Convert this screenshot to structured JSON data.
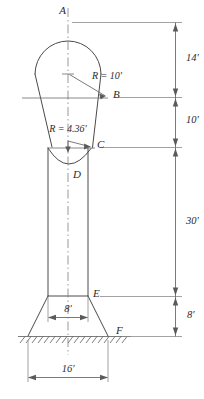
{
  "figure": {
    "points": [
      {
        "id": "A",
        "label": "A",
        "x": 66,
        "y": 14
      },
      {
        "id": "B",
        "label": "B",
        "x": 113,
        "y": 98
      },
      {
        "id": "C",
        "label": "C",
        "x": 97,
        "y": 148
      },
      {
        "id": "D",
        "label": "D",
        "x": 73,
        "y": 178
      },
      {
        "id": "E",
        "label": "E",
        "x": 93,
        "y": 297
      },
      {
        "id": "F",
        "label": "F",
        "x": 116,
        "y": 334
      }
    ],
    "radius_callouts": [
      {
        "id": "r-sphere",
        "label": "R = 10'",
        "value": 10,
        "unit": "ft",
        "x": 92,
        "y": 79
      },
      {
        "id": "r-fillet",
        "label": "R = 4.36'",
        "value": 4.36,
        "unit": "ft",
        "x": 68,
        "y": 132
      }
    ],
    "vertical_dimensions": [
      {
        "id": "dim-14",
        "label": "14'",
        "value": 14,
        "unit": "ft",
        "from": "A",
        "to": "B",
        "x": 186,
        "y": 61
      },
      {
        "id": "dim-10",
        "label": "10'",
        "value": 10,
        "unit": "ft",
        "from": "B",
        "to": "C",
        "x": 186,
        "y": 123
      },
      {
        "id": "dim-30",
        "label": "30'",
        "value": 30,
        "unit": "ft",
        "from": "C",
        "to": "E",
        "x": 186,
        "y": 224
      },
      {
        "id": "dim-8v",
        "label": "8'",
        "value": 8,
        "unit": "ft",
        "from": "E",
        "to": "F",
        "x": 187,
        "y": 318
      }
    ],
    "horizontal_dimensions": [
      {
        "id": "dim-8h",
        "label": "8'",
        "value": 8,
        "unit": "ft",
        "x": 68,
        "y": 312
      },
      {
        "id": "dim-16h",
        "label": "16'",
        "value": 16,
        "unit": "ft",
        "x": 68,
        "y": 372
      }
    ],
    "colors": {
      "outline": "#4a4a4a",
      "dimension": "#6b6b6b",
      "centerline": "#7d7d7d",
      "ground_hatch": "#5a5a5a",
      "text": "#2b2b2b",
      "background": "#ffffff"
    },
    "geometry": {
      "centerline_x": 68,
      "sphere_center_y": 74,
      "sphere_radius_px": 33,
      "shaft_left_x": 48,
      "shaft_right_x": 88,
      "base_top_y": 296,
      "ground_y": 336
    },
    "caption": ""
  }
}
